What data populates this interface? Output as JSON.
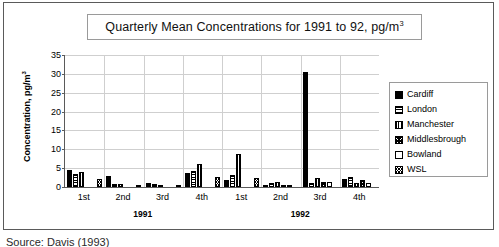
{
  "chart_data": {
    "type": "bar",
    "title_main": "Quarterly Mean Concentrations for 1991 to 92, pg/m",
    "title_sup": "3",
    "xlabel": "",
    "ylabel_main": "Concentration, pg/m",
    "ylabel_sup": "3",
    "ylabel": "Concentration, pg/m³",
    "ylim": [
      0,
      35
    ],
    "ytick_values": [
      0,
      5,
      10,
      15,
      20,
      25,
      30,
      35
    ],
    "ytick_labels": [
      "0",
      "5",
      "10",
      "15",
      "20",
      "25",
      "30",
      "35"
    ],
    "grid": true,
    "grid_color": "#cfcfcf",
    "legend_position": "right",
    "categories": [
      "1st",
      "2nd",
      "3rd",
      "4th",
      "1st",
      "2nd",
      "3rd",
      "4th"
    ],
    "group_labels": [
      {
        "label": "1991",
        "span": 4
      },
      {
        "label": "1992",
        "span": 4
      }
    ],
    "series": [
      {
        "name": "Cardiff",
        "fill": "fill-solid",
        "values": [
          4.5,
          2.9,
          1.0,
          3.8,
          1.8,
          0.4,
          30.5,
          2.1
        ]
      },
      {
        "name": "London",
        "fill": "fill-hbars",
        "values": [
          3.5,
          0.8,
          0.9,
          4.3,
          3.2,
          1.0,
          1.0,
          2.6
        ]
      },
      {
        "name": "Manchester",
        "fill": "fill-vbars",
        "values": [
          4.0,
          0.8,
          0.5,
          6.0,
          8.8,
          1.2,
          2.3,
          1.0
        ]
      },
      {
        "name": "Middlesbrough",
        "fill": "fill-dots",
        "values": [
          0,
          0,
          0,
          0,
          0,
          0.5,
          1.3,
          1.9
        ]
      },
      {
        "name": "Bowland",
        "fill": "fill-white",
        "values": [
          0,
          0,
          0,
          0,
          0,
          0.3,
          1.3,
          1.0
        ]
      },
      {
        "name": "WSL",
        "fill": "fill-check",
        "values": [
          2.2,
          0.6,
          0.4,
          2.7,
          2.4,
          0,
          0,
          0
        ]
      }
    ]
  },
  "legend": {
    "items": [
      {
        "label": "Cardiff",
        "fill": "fill-solid"
      },
      {
        "label": "London",
        "fill": "fill-hbars"
      },
      {
        "label": "Manchester",
        "fill": "fill-vbars"
      },
      {
        "label": "Middlesbrough",
        "fill": "fill-dots"
      },
      {
        "label": "Bowland",
        "fill": "fill-white"
      },
      {
        "label": "WSL",
        "fill": "fill-check"
      }
    ]
  },
  "caption": {
    "text": "Source: Davis (1993)"
  },
  "colors": {
    "frame": "#5a5a5a",
    "grid": "#cfcfcf",
    "bar": "#000000",
    "background": "#ffffff"
  }
}
